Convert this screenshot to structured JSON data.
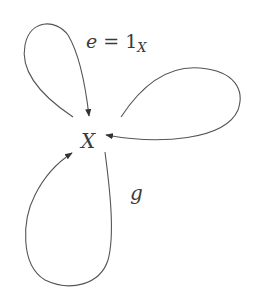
{
  "diagram": {
    "type": "quiver",
    "node": {
      "label": "X"
    },
    "loops": [
      {
        "id": "top-left",
        "label_parts": {
          "var": "e",
          "eq": " = ",
          "one": "1",
          "sub": "X"
        }
      },
      {
        "id": "right",
        "label": ""
      },
      {
        "id": "bottom",
        "label": "g"
      }
    ],
    "colors": {
      "stroke": "#555555",
      "text": "#3a3a3a",
      "background": "#ffffff"
    }
  }
}
